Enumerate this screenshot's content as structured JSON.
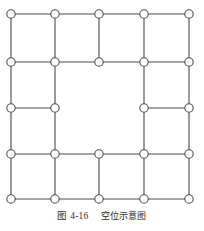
{
  "figure": {
    "caption_number": "图 4-16",
    "caption_text": "空位示意图",
    "caption_full": "图 4-16 空位示意图",
    "type": "lattice-vacancy-schematic"
  },
  "style": {
    "line_color": "#4a4a4a",
    "node_fill": "#ffffff",
    "node_stroke": "#4a4a4a",
    "background": "#ffffff",
    "line_width": 1.1,
    "node_radius": 4.2,
    "node_stroke_width": 1.1
  },
  "chart_data": {
    "type": "diagram",
    "title": "空位示意图",
    "grid": {
      "columns": 5,
      "rows": 5,
      "col_x": [
        11,
        55,
        99,
        144,
        189
      ],
      "row_y": [
        14,
        62,
        108,
        154,
        199
      ],
      "grid_on": false
    },
    "nodes": [
      {
        "id": "r1c1",
        "row": 1,
        "col": 1,
        "x": 11,
        "y": 14
      },
      {
        "id": "r1c2",
        "row": 1,
        "col": 2,
        "x": 55,
        "y": 14
      },
      {
        "id": "r1c3",
        "row": 1,
        "col": 3,
        "x": 99,
        "y": 14
      },
      {
        "id": "r1c4",
        "row": 1,
        "col": 4,
        "x": 144,
        "y": 14
      },
      {
        "id": "r1c5",
        "row": 1,
        "col": 5,
        "x": 189,
        "y": 14
      },
      {
        "id": "r2c1",
        "row": 2,
        "col": 1,
        "x": 11,
        "y": 62
      },
      {
        "id": "r2c2",
        "row": 2,
        "col": 2,
        "x": 55,
        "y": 62
      },
      {
        "id": "r2c3",
        "row": 2,
        "col": 3,
        "x": 99,
        "y": 62
      },
      {
        "id": "r2c4",
        "row": 2,
        "col": 4,
        "x": 144,
        "y": 62
      },
      {
        "id": "r2c5",
        "row": 2,
        "col": 5,
        "x": 189,
        "y": 62
      },
      {
        "id": "r3c1",
        "row": 3,
        "col": 1,
        "x": 11,
        "y": 108
      },
      {
        "id": "r3c2",
        "row": 3,
        "col": 2,
        "x": 55,
        "y": 108
      },
      {
        "id": "r3c4",
        "row": 3,
        "col": 4,
        "x": 144,
        "y": 108
      },
      {
        "id": "r3c5",
        "row": 3,
        "col": 5,
        "x": 189,
        "y": 108
      },
      {
        "id": "r4c1",
        "row": 4,
        "col": 1,
        "x": 11,
        "y": 154
      },
      {
        "id": "r4c2",
        "row": 4,
        "col": 2,
        "x": 55,
        "y": 154
      },
      {
        "id": "r4c3",
        "row": 4,
        "col": 3,
        "x": 99,
        "y": 154
      },
      {
        "id": "r4c4",
        "row": 4,
        "col": 4,
        "x": 144,
        "y": 154
      },
      {
        "id": "r4c5",
        "row": 4,
        "col": 5,
        "x": 189,
        "y": 154
      },
      {
        "id": "r5c1",
        "row": 5,
        "col": 1,
        "x": 11,
        "y": 199
      },
      {
        "id": "r5c2",
        "row": 5,
        "col": 2,
        "x": 55,
        "y": 199
      },
      {
        "id": "r5c3",
        "row": 5,
        "col": 3,
        "x": 99,
        "y": 199
      },
      {
        "id": "r5c4",
        "row": 5,
        "col": 4,
        "x": 144,
        "y": 199
      },
      {
        "id": "r5c5",
        "row": 5,
        "col": 5,
        "x": 189,
        "y": 199
      }
    ],
    "vacancies": [
      {
        "row": 3,
        "col": 3,
        "x": 99,
        "y": 108,
        "note": "missing lattice node (空位)"
      }
    ],
    "edges": [
      {
        "from": "r1c1",
        "to": "r1c2",
        "x1": 11,
        "y1": 14,
        "x2": 55,
        "y2": 14
      },
      {
        "from": "r1c2",
        "to": "r1c3",
        "x1": 55,
        "y1": 14,
        "x2": 99,
        "y2": 14
      },
      {
        "from": "r1c3",
        "to": "r1c4",
        "x1": 99,
        "y1": 14,
        "x2": 144,
        "y2": 14
      },
      {
        "from": "r1c4",
        "to": "r1c5",
        "x1": 144,
        "y1": 14,
        "x2": 189,
        "y2": 14
      },
      {
        "from": "r2c1",
        "to": "r2c2",
        "x1": 11,
        "y1": 62,
        "x2": 55,
        "y2": 62
      },
      {
        "from": "r2c2",
        "to": "r2c3",
        "x1": 55,
        "y1": 62,
        "x2": 99,
        "y2": 62
      },
      {
        "from": "r2c3",
        "to": "r2c4",
        "x1": 99,
        "y1": 62,
        "x2": 144,
        "y2": 62
      },
      {
        "from": "r2c4",
        "to": "r2c5",
        "x1": 144,
        "y1": 62,
        "x2": 189,
        "y2": 62
      },
      {
        "from": "r3c1",
        "to": "r3c2",
        "x1": 11,
        "y1": 108,
        "x2": 55,
        "y2": 108
      },
      {
        "from": "r3c4",
        "to": "r3c5",
        "x1": 144,
        "y1": 108,
        "x2": 189,
        "y2": 108
      },
      {
        "from": "r4c1",
        "to": "r4c2",
        "x1": 11,
        "y1": 154,
        "x2": 55,
        "y2": 154
      },
      {
        "from": "r4c2",
        "to": "r4c3",
        "x1": 55,
        "y1": 154,
        "x2": 99,
        "y2": 154
      },
      {
        "from": "r4c3",
        "to": "r4c4",
        "x1": 99,
        "y1": 154,
        "x2": 144,
        "y2": 154
      },
      {
        "from": "r4c4",
        "to": "r4c5",
        "x1": 144,
        "y1": 154,
        "x2": 189,
        "y2": 154
      },
      {
        "from": "r5c1",
        "to": "r5c2",
        "x1": 11,
        "y1": 199,
        "x2": 55,
        "y2": 199
      },
      {
        "from": "r5c2",
        "to": "r5c3",
        "x1": 55,
        "y1": 199,
        "x2": 99,
        "y2": 199
      },
      {
        "from": "r5c3",
        "to": "r5c4",
        "x1": 99,
        "y1": 199,
        "x2": 144,
        "y2": 199
      },
      {
        "from": "r5c4",
        "to": "r5c5",
        "x1": 144,
        "y1": 199,
        "x2": 189,
        "y2": 199
      },
      {
        "from": "r1c1",
        "to": "r2c1",
        "x1": 11,
        "y1": 14,
        "x2": 11,
        "y2": 62
      },
      {
        "from": "r1c2",
        "to": "r2c2",
        "x1": 55,
        "y1": 14,
        "x2": 55,
        "y2": 62
      },
      {
        "from": "r1c3",
        "to": "r2c3",
        "x1": 99,
        "y1": 14,
        "x2": 99,
        "y2": 62
      },
      {
        "from": "r1c4",
        "to": "r2c4",
        "x1": 144,
        "y1": 14,
        "x2": 144,
        "y2": 62
      },
      {
        "from": "r1c5",
        "to": "r2c5",
        "x1": 189,
        "y1": 14,
        "x2": 189,
        "y2": 62
      },
      {
        "from": "r2c1",
        "to": "r3c1",
        "x1": 11,
        "y1": 62,
        "x2": 11,
        "y2": 108
      },
      {
        "from": "r2c2",
        "to": "r3c2",
        "x1": 55,
        "y1": 62,
        "x2": 55,
        "y2": 108
      },
      {
        "from": "r2c4",
        "to": "r3c4",
        "x1": 144,
        "y1": 62,
        "x2": 144,
        "y2": 108
      },
      {
        "from": "r2c5",
        "to": "r3c5",
        "x1": 189,
        "y1": 62,
        "x2": 189,
        "y2": 108
      },
      {
        "from": "r3c1",
        "to": "r4c1",
        "x1": 11,
        "y1": 108,
        "x2": 11,
        "y2": 154
      },
      {
        "from": "r3c2",
        "to": "r4c2",
        "x1": 55,
        "y1": 108,
        "x2": 55,
        "y2": 154
      },
      {
        "from": "r3c4",
        "to": "r4c4",
        "x1": 144,
        "y1": 108,
        "x2": 144,
        "y2": 154
      },
      {
        "from": "r3c5",
        "to": "r4c5",
        "x1": 189,
        "y1": 108,
        "x2": 189,
        "y2": 154
      },
      {
        "from": "r4c1",
        "to": "r5c1",
        "x1": 11,
        "y1": 154,
        "x2": 11,
        "y2": 199
      },
      {
        "from": "r4c2",
        "to": "r5c2",
        "x1": 55,
        "y1": 154,
        "x2": 55,
        "y2": 199
      },
      {
        "from": "r4c3",
        "to": "r5c3",
        "x1": 99,
        "y1": 154,
        "x2": 99,
        "y2": 199
      },
      {
        "from": "r4c4",
        "to": "r5c4",
        "x1": 144,
        "y1": 154,
        "x2": 144,
        "y2": 199
      },
      {
        "from": "r4c5",
        "to": "r5c5",
        "x1": 189,
        "y1": 154,
        "x2": 189,
        "y2": 199
      }
    ],
    "missing_edges": [
      {
        "from": "r2c3",
        "to": "r3c3",
        "note": "vertical edge absent at vacancy column"
      },
      {
        "from": "r3c2",
        "to": "r3c3",
        "note": "horizontal edge absent left of vacancy"
      },
      {
        "from": "r3c3",
        "to": "r3c4",
        "note": "horizontal edge absent right of vacancy"
      },
      {
        "from": "r3c3",
        "to": "r4c3",
        "note": "vertical edge absent below vacancy"
      }
    ]
  }
}
